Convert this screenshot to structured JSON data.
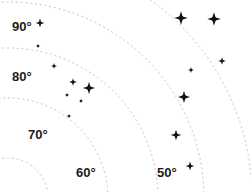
{
  "chart_data": {
    "type": "scatter",
    "title": "",
    "subtitle": "",
    "xlabel": "",
    "ylabel": "",
    "grid": "polar-arcs-dashed",
    "legend": "none",
    "background_color": "#ffffff",
    "marker_color": "#111111",
    "gridline_color": "#b9b9b9",
    "axis_tick_labels": [
      {
        "text": "90°",
        "x": 12,
        "y": 20
      },
      {
        "text": "80°",
        "x": 12,
        "y": 70
      },
      {
        "text": "70°",
        "x": 28,
        "y": 128
      },
      {
        "text": "60°",
        "x": 76,
        "y": 166
      },
      {
        "text": "50°",
        "x": 157,
        "y": 166
      }
    ],
    "arcs": [
      {
        "label": "90°",
        "radius": 40,
        "cx": 8,
        "cy": 198
      },
      {
        "label": "80°",
        "radius": 100,
        "cx": 8,
        "cy": 198
      },
      {
        "label": "70°",
        "radius": 150,
        "cx": 8,
        "cy": 198
      },
      {
        "label": "60°",
        "radius": 196,
        "cx": 8,
        "cy": 198
      },
      {
        "label": "50°",
        "radius": 244,
        "cx": 8,
        "cy": 198
      }
    ],
    "points": [
      {
        "x": 40,
        "y": 23,
        "size": 6
      },
      {
        "x": 38,
        "y": 46,
        "size": 3
      },
      {
        "x": 54,
        "y": 66,
        "size": 4
      },
      {
        "x": 73,
        "y": 82,
        "size": 5
      },
      {
        "x": 89,
        "y": 88,
        "size": 8
      },
      {
        "x": 67,
        "y": 95,
        "size": 3
      },
      {
        "x": 81,
        "y": 101,
        "size": 3
      },
      {
        "x": 69,
        "y": 116,
        "size": 3
      },
      {
        "x": 181,
        "y": 18,
        "size": 9
      },
      {
        "x": 214,
        "y": 19,
        "size": 9
      },
      {
        "x": 191,
        "y": 70,
        "size": 4
      },
      {
        "x": 222,
        "y": 61,
        "size": 5
      },
      {
        "x": 184,
        "y": 97,
        "size": 8
      },
      {
        "x": 176,
        "y": 135,
        "size": 7
      },
      {
        "x": 190,
        "y": 166,
        "size": 6
      }
    ],
    "xlim": [
      0,
      251
    ],
    "ylim": [
      0,
      192
    ]
  }
}
